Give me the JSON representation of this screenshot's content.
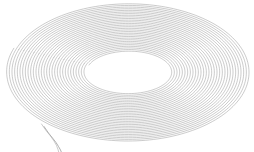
{
  "figure": {
    "subject_name": "coil-spiral",
    "background_color": "#ffffff",
    "width": 254,
    "height": 152
  },
  "chart_data": {
    "type": "line",
    "subtitle": "",
    "xlabel": "",
    "ylabel": "",
    "xlim": [
      0,
      254
    ],
    "ylim": [
      0,
      152
    ],
    "grid": false,
    "legend": null,
    "annotations": [],
    "tick_labels": {
      "x": [],
      "y": []
    },
    "geometry": {
      "shape": "archimedean-spiral-ellipse",
      "center_x": 128.5,
      "center_y": 72.0,
      "outer_radius_x": 122.0,
      "outer_radius_y": 69.5,
      "inner_radius_x": 42.0,
      "inner_radius_y": 20.5,
      "turns": 30,
      "start_angle_deg": 200,
      "points_per_turn": 180,
      "stroke_color": "#9a9a9a",
      "stroke_width": 0.55,
      "stroke_opacity": 0.95
    },
    "tail": {
      "name": "loose-end-tail",
      "stroke_color": "#9a9a9a",
      "stroke_width": 0.8,
      "points": [
        [
          44.0,
          126.5
        ],
        [
          48.5,
          133.0
        ],
        [
          52.5,
          138.0
        ],
        [
          56.0,
          142.5
        ],
        [
          58.5,
          146.5
        ],
        [
          60.5,
          150.0
        ],
        [
          61.5,
          152.5
        ]
      ]
    },
    "tail_inner": {
      "name": "loose-end-tail-inner",
      "stroke_color": "#b4b4b4",
      "stroke_width": 0.7,
      "points": [
        [
          41.5,
          124.0
        ],
        [
          46.0,
          130.5
        ],
        [
          50.5,
          136.0
        ],
        [
          54.0,
          141.0
        ],
        [
          56.5,
          145.5
        ],
        [
          58.0,
          149.5
        ],
        [
          58.8,
          152.5
        ]
      ]
    }
  }
}
